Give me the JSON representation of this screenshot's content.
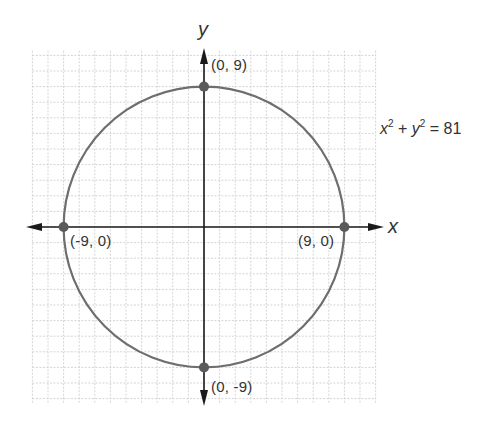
{
  "chart_data": {
    "type": "scatter",
    "title": "",
    "equation": "x^2 + y^2 = 81",
    "equation_parts": {
      "x": "x",
      "x_exp": "2",
      "plus": " + ",
      "y": "y",
      "y_exp": "2",
      "rhs": " = 81"
    },
    "xlabel": "x",
    "ylabel": "y",
    "xlim": [
      -11,
      11
    ],
    "ylim": [
      -11,
      9.5
    ],
    "grid": true,
    "circle": {
      "cx": 0,
      "cy": 0,
      "r": 9
    },
    "points": [
      {
        "x": 0,
        "y": 9,
        "label": "(0, 9)"
      },
      {
        "x": -9,
        "y": 0,
        "label": "(-9, 0)"
      },
      {
        "x": 9,
        "y": 0,
        "label": "(9, 0)"
      },
      {
        "x": 0,
        "y": -9,
        "label": "(0, -9)"
      }
    ],
    "colors": {
      "curve": "#6e6e6e",
      "point": "#5a5a5a",
      "axis": "#1a1a1a",
      "grid": "#d4d4d4"
    }
  }
}
